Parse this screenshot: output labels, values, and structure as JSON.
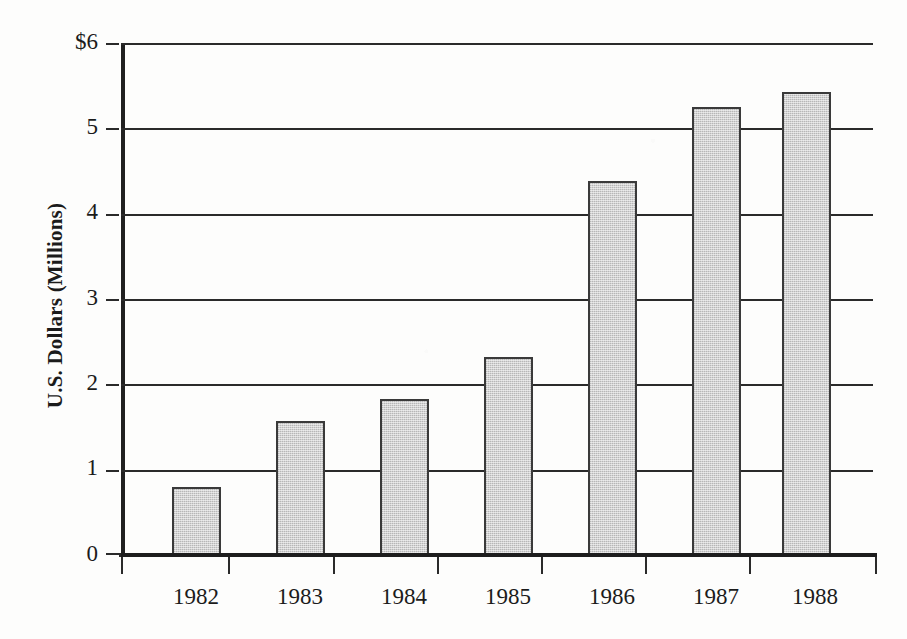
{
  "chart_data": {
    "type": "bar",
    "title": "",
    "subtitle": "",
    "xlabel": "",
    "ylabel": "U.S. Dollars (Millions)",
    "categories": [
      "1982",
      "1983",
      "1984",
      "1985",
      "1986",
      "1987",
      "1988"
    ],
    "values": [
      0.8,
      1.57,
      1.83,
      2.32,
      4.38,
      5.25,
      5.43
    ],
    "series": [
      {
        "name": "U.S. Dollars (Millions)",
        "values": [
          0.8,
          1.57,
          1.83,
          2.32,
          4.38,
          5.25,
          5.43
        ]
      }
    ],
    "ylim": [
      0,
      6
    ],
    "yticks": [
      0,
      1,
      2,
      3,
      4,
      5,
      6
    ],
    "ytick_labels": [
      "0",
      "1",
      "2",
      "3",
      "4",
      "5",
      "$6"
    ],
    "xtick_labels": [
      "1982",
      "1983",
      "1984",
      "1985",
      "1986",
      "1987",
      "1988"
    ],
    "grid": "horizontal",
    "legend": "none",
    "bar_fill_color": "#d2d2d2",
    "bar_edge_color": "#3a3a3a",
    "axis_color": "#1d1d1d",
    "background_color": "#fdfdfc"
  },
  "axis": {
    "y_title": "U.S. Dollars (Millions)",
    "y_labels": [
      "$6",
      "5",
      "4",
      "3",
      "2",
      "1",
      "0"
    ],
    "x_labels": [
      "1982",
      "1983",
      "1984",
      "1985",
      "1986",
      "1987",
      "1988"
    ]
  }
}
